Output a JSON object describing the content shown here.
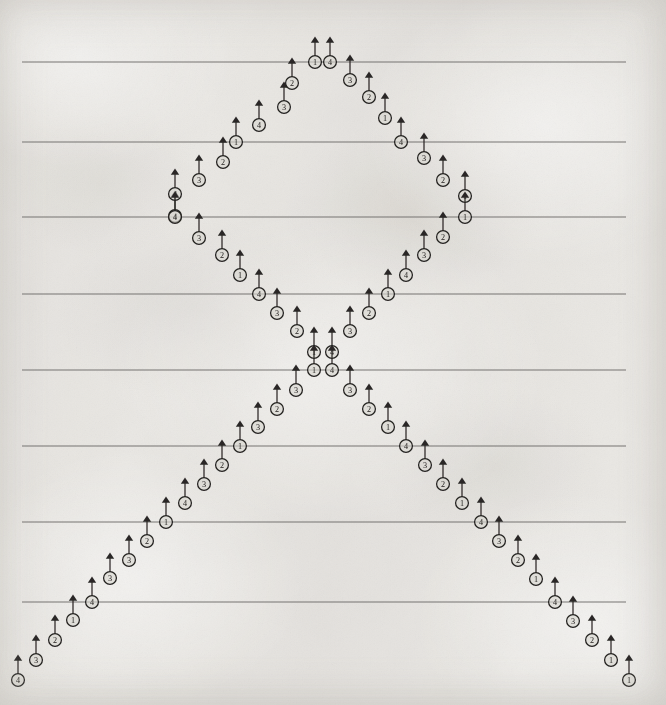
{
  "document": {
    "kind": "scanned-music-fingering-diagram",
    "title": "Fingering pattern diagram",
    "width": 666,
    "height": 705,
    "background_color": "#f4f3f1",
    "ink_color": "#23211f",
    "line_color": "#6e6c69",
    "notehead_fill": "#d9d6d1"
  },
  "staff": {
    "label": "horizontal-rules",
    "line_x_start": 22,
    "line_x_end": 626,
    "count": 8,
    "y_positions": [
      62,
      142,
      217,
      294,
      370,
      446,
      522,
      602
    ]
  },
  "legend": {
    "digit_meaning": "finger number",
    "digits": [
      "1",
      "2",
      "3",
      "4"
    ],
    "marker_description": "circled digit with upward stem and arrowhead"
  },
  "chart_data": {
    "type": "scatter",
    "xlabel": "",
    "ylabel": "",
    "xlim": [
      0,
      666
    ],
    "ylim": [
      705,
      0
    ],
    "grid": true,
    "legend_position": "none",
    "gridlines_y": [
      62,
      142,
      217,
      294,
      370,
      446,
      522,
      602
    ],
    "marker": "circled-digit-with-up-arrow",
    "point_labels_are": "finger numbers 1-4",
    "series": [
      {
        "name": "upper-left-ascending",
        "label": "upper left rising branch",
        "points": [
          {
            "x": 175,
            "y": 216,
            "label": "4"
          },
          {
            "x": 175,
            "y": 194,
            "label": "4"
          },
          {
            "x": 199,
            "y": 180,
            "label": "3"
          },
          {
            "x": 223,
            "y": 162,
            "label": "2"
          },
          {
            "x": 236,
            "y": 142,
            "label": "1"
          },
          {
            "x": 259,
            "y": 125,
            "label": "4"
          },
          {
            "x": 284,
            "y": 107,
            "label": "3"
          },
          {
            "x": 292,
            "y": 83,
            "label": "2"
          },
          {
            "x": 315,
            "y": 62,
            "label": "1"
          }
        ]
      },
      {
        "name": "top-apex",
        "label": "top apex stacked pair",
        "points": [
          {
            "x": 315,
            "y": 62,
            "label": "1"
          },
          {
            "x": 330,
            "y": 62,
            "label": "4"
          }
        ]
      },
      {
        "name": "upper-right-descending",
        "label": "upper right falling branch",
        "points": [
          {
            "x": 330,
            "y": 62,
            "label": "4"
          },
          {
            "x": 350,
            "y": 80,
            "label": "3"
          },
          {
            "x": 369,
            "y": 97,
            "label": "2"
          },
          {
            "x": 385,
            "y": 118,
            "label": "1"
          },
          {
            "x": 401,
            "y": 142,
            "label": "4"
          },
          {
            "x": 424,
            "y": 158,
            "label": "3"
          },
          {
            "x": 443,
            "y": 180,
            "label": "2"
          },
          {
            "x": 465,
            "y": 196,
            "label": "1"
          },
          {
            "x": 465,
            "y": 217,
            "label": "1"
          }
        ]
      },
      {
        "name": "left-inner-descending",
        "label": "left inner falling branch",
        "points": [
          {
            "x": 175,
            "y": 217,
            "label": "4"
          },
          {
            "x": 199,
            "y": 238,
            "label": "3"
          },
          {
            "x": 222,
            "y": 255,
            "label": "2"
          },
          {
            "x": 240,
            "y": 275,
            "label": "1"
          },
          {
            "x": 259,
            "y": 294,
            "label": "4"
          },
          {
            "x": 277,
            "y": 313,
            "label": "3"
          },
          {
            "x": 297,
            "y": 331,
            "label": "2"
          },
          {
            "x": 314,
            "y": 352,
            "label": "1"
          },
          {
            "x": 314,
            "y": 370,
            "label": "1"
          }
        ]
      },
      {
        "name": "right-inner-descending",
        "label": "right inner falling branch",
        "points": [
          {
            "x": 465,
            "y": 217,
            "label": "1"
          },
          {
            "x": 443,
            "y": 237,
            "label": "2"
          },
          {
            "x": 424,
            "y": 255,
            "label": "3"
          },
          {
            "x": 406,
            "y": 275,
            "label": "4"
          },
          {
            "x": 388,
            "y": 294,
            "label": "1"
          },
          {
            "x": 369,
            "y": 313,
            "label": "2"
          },
          {
            "x": 350,
            "y": 331,
            "label": "3"
          },
          {
            "x": 332,
            "y": 352,
            "label": "4"
          },
          {
            "x": 332,
            "y": 370,
            "label": "4"
          }
        ]
      },
      {
        "name": "lower-left-descending",
        "label": "lower left falling branch",
        "points": [
          {
            "x": 314,
            "y": 370,
            "label": "1"
          },
          {
            "x": 296,
            "y": 390,
            "label": "3"
          },
          {
            "x": 277,
            "y": 409,
            "label": "2"
          },
          {
            "x": 258,
            "y": 427,
            "label": "3"
          },
          {
            "x": 240,
            "y": 446,
            "label": "1"
          },
          {
            "x": 222,
            "y": 465,
            "label": "2"
          },
          {
            "x": 204,
            "y": 484,
            "label": "3"
          },
          {
            "x": 185,
            "y": 503,
            "label": "4"
          },
          {
            "x": 166,
            "y": 522,
            "label": "1"
          },
          {
            "x": 147,
            "y": 541,
            "label": "2"
          },
          {
            "x": 129,
            "y": 560,
            "label": "3"
          },
          {
            "x": 110,
            "y": 578,
            "label": "3"
          },
          {
            "x": 92,
            "y": 602,
            "label": "4"
          },
          {
            "x": 73,
            "y": 620,
            "label": "1"
          },
          {
            "x": 55,
            "y": 640,
            "label": "2"
          },
          {
            "x": 36,
            "y": 660,
            "label": "3"
          },
          {
            "x": 18,
            "y": 680,
            "label": "4"
          }
        ]
      },
      {
        "name": "lower-right-descending",
        "label": "lower right falling branch",
        "points": [
          {
            "x": 332,
            "y": 370,
            "label": "4"
          },
          {
            "x": 350,
            "y": 390,
            "label": "3"
          },
          {
            "x": 369,
            "y": 409,
            "label": "2"
          },
          {
            "x": 388,
            "y": 427,
            "label": "1"
          },
          {
            "x": 406,
            "y": 446,
            "label": "4"
          },
          {
            "x": 425,
            "y": 465,
            "label": "3"
          },
          {
            "x": 443,
            "y": 484,
            "label": "2"
          },
          {
            "x": 462,
            "y": 503,
            "label": "1"
          },
          {
            "x": 481,
            "y": 522,
            "label": "4"
          },
          {
            "x": 499,
            "y": 541,
            "label": "3"
          },
          {
            "x": 518,
            "y": 560,
            "label": "2"
          },
          {
            "x": 536,
            "y": 579,
            "label": "1"
          },
          {
            "x": 555,
            "y": 602,
            "label": "4"
          },
          {
            "x": 573,
            "y": 621,
            "label": "3"
          },
          {
            "x": 592,
            "y": 640,
            "label": "2"
          },
          {
            "x": 611,
            "y": 660,
            "label": "1"
          },
          {
            "x": 629,
            "y": 680,
            "label": "1"
          }
        ]
      }
    ]
  }
}
